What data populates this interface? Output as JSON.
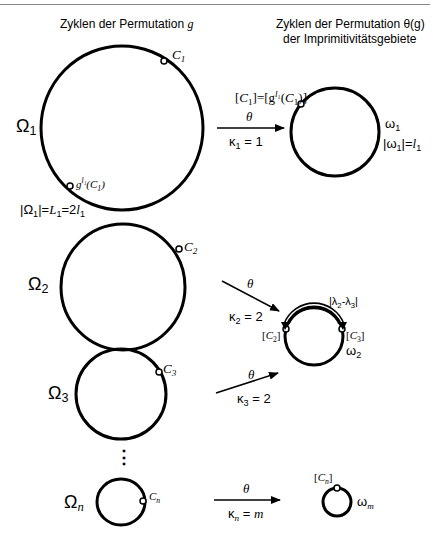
{
  "header": {
    "left_title": "Zyklen der Permutation",
    "left_title_var": "g",
    "right_title_line1": "Zyklen der Permutation θ(g)",
    "right_title_line2": "der Imprimitivitätsgebiete"
  },
  "rows": [
    {
      "omega": "Ω",
      "omega_sub": "1",
      "point": "C",
      "point_sub": "1",
      "second_point": "g",
      "second_point_sup": "l1",
      "second_point_arg": "(C1)",
      "size_label": "|Ω1|=L1=2l1",
      "map_symbol": "θ",
      "kappa": "κ",
      "kappa_sub": "1",
      "kappa_value": "= 1",
      "class_label": "[C1]=[g l1(C1)]",
      "image_omega": "ω",
      "image_omega_sub": "1",
      "image_size_label": "|ω1|=l1"
    },
    {
      "omega": "Ω",
      "omega_sub": "2",
      "point": "C",
      "point_sub": "2",
      "map_symbol": "θ",
      "kappa": "κ",
      "kappa_sub": "2",
      "kappa_value": "= 2"
    },
    {
      "omega": "Ω",
      "omega_sub": "3",
      "point": "C",
      "point_sub": "3",
      "map_symbol": "θ",
      "kappa": "κ",
      "kappa_sub": "3",
      "kappa_value": "= 2"
    },
    {
      "omega": "Ω",
      "omega_sub": "n",
      "point": "C",
      "point_sub": "n",
      "map_symbol": "θ",
      "kappa": "κ",
      "kappa_sub": "n",
      "kappa_value": "= m",
      "class_label": "[Cn]",
      "image_omega": "ω",
      "image_omega_sub": "m"
    }
  ],
  "shared_target": {
    "image_omega": "ω",
    "image_omega_sub": "2",
    "left_class": "[C2]",
    "right_class": "[C3]",
    "arc_label": "|λ2-λ3|"
  },
  "ellipsis": "⋮",
  "colors": {
    "stroke": "#000000",
    "background": "#ffffff",
    "rule": "#888888"
  }
}
